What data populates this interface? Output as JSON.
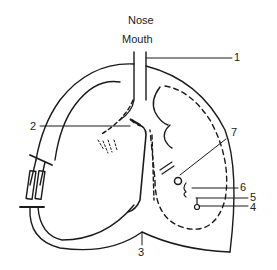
{
  "diagram": {
    "top_labels": [
      "Nose",
      "Mouth"
    ],
    "callouts": [
      {
        "id": "1",
        "label": "1"
      },
      {
        "id": "2",
        "label": "2"
      },
      {
        "id": "3",
        "label": "3"
      },
      {
        "id": "4",
        "label": "4"
      },
      {
        "id": "5",
        "label": "5"
      },
      {
        "id": "6",
        "label": "6"
      },
      {
        "id": "7",
        "label": "7"
      }
    ],
    "colors": {
      "line": "#1a1a1a",
      "background": "#ffffff"
    }
  }
}
